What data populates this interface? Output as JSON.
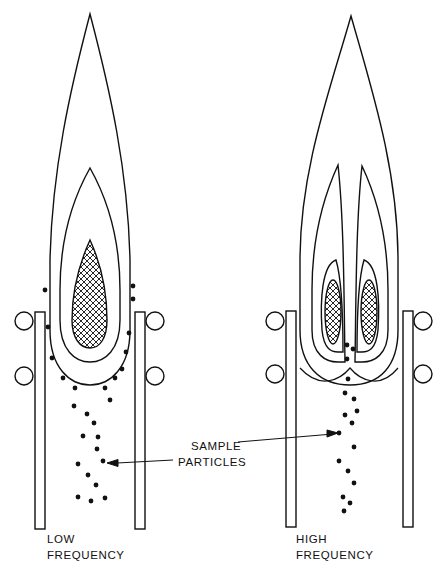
{
  "diagram": {
    "type": "ICP torch flame comparison",
    "panels": [
      {
        "id": "low",
        "label_line1": "LOW",
        "label_line2": "FREQUENCY",
        "core_shape": "single teardrop"
      },
      {
        "id": "high",
        "label_line1": "HIGH",
        "label_line2": "FREQUENCY",
        "core_shape": "twin ellipses (toroidal)"
      }
    ],
    "callout": {
      "line1": "SAMPLE",
      "line2": "PARTICLES"
    },
    "colors": {
      "ink": "#111111",
      "background": "#ffffff"
    }
  }
}
